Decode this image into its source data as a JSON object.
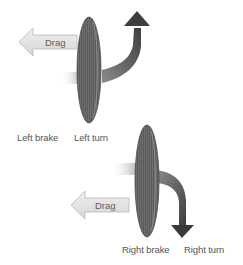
{
  "diagram": {
    "upper": {
      "drag_label": "Drag",
      "brake_label": "Left brake",
      "turn_label": "Left turn",
      "turn_direction": "up"
    },
    "lower": {
      "drag_label": "Drag",
      "brake_label": "Right brake",
      "turn_label": "Right turn",
      "turn_direction": "down"
    },
    "colors": {
      "disc_fill": "#6b6b6b",
      "disc_edge": "#4a4a4a",
      "turn_arrow": "#5a5a5a",
      "drag_arrow_fill": "#e2e2e2",
      "drag_arrow_stroke": "#b8b8b8",
      "label_text": "#555555"
    }
  }
}
